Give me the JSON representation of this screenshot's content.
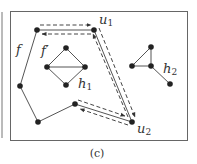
{
  "figure": {
    "caption": "(c)",
    "colors": {
      "stroke": "#555555",
      "node": "#222222",
      "frame": "#666666",
      "background": "#ffffff"
    },
    "labels": {
      "f": "f",
      "f_prime": "f′",
      "h1_main": "h",
      "h1_sub": "1",
      "h2_main": "h",
      "h2_sub": "2",
      "u1_main": "u",
      "u1_sub": "1",
      "u2_main": "u",
      "u2_sub": "2"
    },
    "outer_face_vertices": [
      {
        "id": "v_top",
        "x": 37,
        "y": 30
      },
      {
        "id": "u1",
        "x": 94,
        "y": 30
      },
      {
        "id": "u2",
        "x": 132,
        "y": 122
      },
      {
        "id": "v_mid",
        "x": 75,
        "y": 104
      },
      {
        "id": "v_bottom",
        "x": 38,
        "y": 122
      },
      {
        "id": "v_left",
        "x": 20,
        "y": 86
      }
    ],
    "h1_vertices": [
      {
        "id": "top",
        "x": 66,
        "y": 48
      },
      {
        "id": "left",
        "x": 47,
        "y": 67
      },
      {
        "id": "right",
        "x": 85,
        "y": 67
      },
      {
        "id": "bottom",
        "x": 66,
        "y": 85
      }
    ],
    "h2_vertices": [
      {
        "id": "top",
        "x": 151,
        "y": 47
      },
      {
        "id": "left",
        "x": 132,
        "y": 66
      },
      {
        "id": "center",
        "x": 151,
        "y": 66
      },
      {
        "id": "tail",
        "x": 170,
        "y": 84
      }
    ],
    "dashed_walk": "v_top → u1 → u2 → v_mid (and back)"
  }
}
